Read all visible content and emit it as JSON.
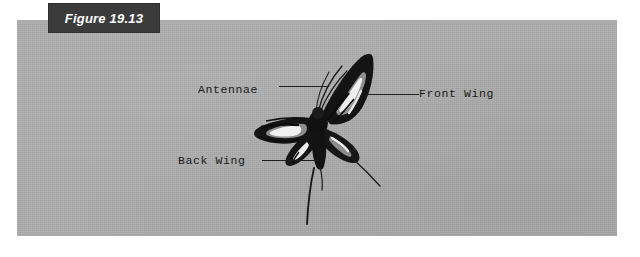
{
  "figure": {
    "tab_label": "Figure 19.13",
    "panel_background_color": "#adadad",
    "tab_background_color": "#3b3b3b",
    "tab_text_color": "#ffffff",
    "page_background_color": "#ffffff"
  },
  "callouts": [
    {
      "id": "antennae",
      "label": "Antennae",
      "leader": "line-to-right"
    },
    {
      "id": "front_wing",
      "label": "Front Wing",
      "leader": "line-to-left"
    },
    {
      "id": "back_wing",
      "label": "Back Wing",
      "leader": "line-to-right"
    }
  ],
  "illustration": {
    "subject": "butterfly-specimen",
    "description_parts": [
      "antennae",
      "front-wing-left",
      "front-wing-right",
      "back-wing-left",
      "back-wing-right",
      "body",
      "tail"
    ],
    "wing_dark_color": "#141414",
    "wing_band_color": "#f2f2f2",
    "wing_mid_color": "#8f8f8f"
  }
}
